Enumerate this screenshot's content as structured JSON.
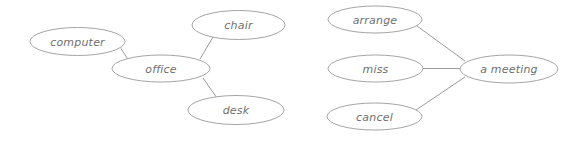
{
  "diagram": {
    "type": "semantic-network-graph",
    "canvas": {
      "width": 578,
      "height": 145,
      "background": "#ffffff"
    },
    "style": {
      "node_stroke": "#9a9a9a",
      "node_fill": "#ffffff",
      "edge_stroke": "#8e8e8e",
      "label_color": "#6f6f6f"
    },
    "clusters": [
      {
        "id": "office-cluster",
        "name": "office-collocations",
        "hub": "office",
        "nodes": [
          {
            "id": "computer",
            "label": "computer",
            "cx": 77.5,
            "cy": 41.5,
            "rx": 47.5,
            "ry": 14.0
          },
          {
            "id": "office",
            "label": "office",
            "cx": 161.0,
            "cy": 68.5,
            "rx": 49.0,
            "ry": 13.5
          },
          {
            "id": "chair",
            "label": "chair",
            "cx": 238.5,
            "cy": 25.0,
            "rx": 46.5,
            "ry": 14.5
          },
          {
            "id": "desk",
            "label": "desk",
            "cx": 236.0,
            "cy": 110.0,
            "rx": 48.0,
            "ry": 14.5
          }
        ],
        "edges": [
          {
            "from": "computer",
            "to": "office",
            "x1": 121.0,
            "y1": 48.5,
            "x2": 128.0,
            "y2": 59.5
          },
          {
            "from": "office",
            "to": "chair",
            "x1": 200.0,
            "y1": 59.0,
            "x2": 213.0,
            "y2": 37.0
          },
          {
            "from": "office",
            "to": "desk",
            "x1": 203.0,
            "y1": 78.0,
            "x2": 217.0,
            "y2": 98.0
          }
        ]
      },
      {
        "id": "meeting-cluster",
        "name": "meeting-collocations",
        "hub": "a meeting",
        "nodes": [
          {
            "id": "arrange",
            "label": "arrange",
            "cx": 375.0,
            "cy": 19.5,
            "rx": 47.0,
            "ry": 13.5
          },
          {
            "id": "miss",
            "label": "miss",
            "cx": 375.5,
            "cy": 68.5,
            "rx": 47.5,
            "ry": 13.5
          },
          {
            "id": "cancel",
            "label": "cancel",
            "cx": 374.5,
            "cy": 116.5,
            "rx": 47.5,
            "ry": 13.5
          },
          {
            "id": "a-meeting",
            "label": "a meeting",
            "cx": 509.0,
            "cy": 69.0,
            "rx": 49.0,
            "ry": 14.0
          }
        ],
        "edges": [
          {
            "from": "arrange",
            "to": "a-meeting",
            "x1": 417.0,
            "y1": 26.0,
            "x2": 465.0,
            "y2": 61.0
          },
          {
            "from": "miss",
            "to": "a-meeting",
            "x1": 423.0,
            "y1": 68.5,
            "x2": 460.5,
            "y2": 68.5
          },
          {
            "from": "cancel",
            "to": "a-meeting",
            "x1": 416.0,
            "y1": 110.0,
            "x2": 465.0,
            "y2": 77.0
          }
        ]
      }
    ]
  }
}
